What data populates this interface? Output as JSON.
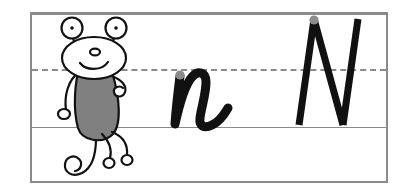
{
  "worksheet": {
    "title": "Letter N handwriting practice row",
    "letters": {
      "lowercase": "n",
      "uppercase": "N",
      "lowercase_name": "lowercase-letter-n",
      "uppercase_name": "uppercase-letter-n"
    },
    "guide_lines": {
      "top_label": "top line",
      "middle_label": "dashed midline",
      "baseline_label": "baseline"
    },
    "mascot": {
      "label": "cartoon creature with stalk eyes",
      "parts": [
        "left-eye-stalk",
        "right-eye-stalk",
        "head",
        "nose",
        "smile",
        "body",
        "left-arm",
        "right-arm",
        "left-leg",
        "right-leg",
        "curly-tail"
      ]
    },
    "start_dots": {
      "lowercase_label": "start dot for n",
      "uppercase_label": "start dot for N"
    },
    "colors": {
      "frame": "#8a8a8a",
      "rule": "#8a8a8a",
      "ink": "#111111",
      "body_fill": "#808080",
      "start_dot": "#8c8c8c",
      "page": "#ffffff"
    }
  }
}
